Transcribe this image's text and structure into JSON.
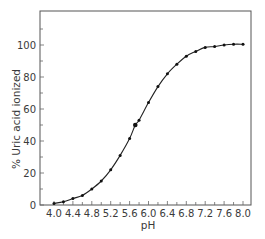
{
  "chart_data": {
    "type": "line",
    "title": "",
    "xlabel": "pH",
    "ylabel": "% Uric acid ionized",
    "xlim": [
      3.7,
      8.2
    ],
    "ylim": [
      0,
      120
    ],
    "x_ticks": [
      4.0,
      4.4,
      4.8,
      5.2,
      5.6,
      6.0,
      6.4,
      6.8,
      7.2,
      7.6,
      8.0
    ],
    "x_tick_labels": [
      "4.0",
      "4.4",
      "4.8",
      "5.2",
      "5.6",
      "6.0",
      "6.4",
      "6.8",
      "7.2",
      "7.6",
      "8.0"
    ],
    "x_minor_step": 0.2,
    "y_ticks": [
      0,
      20,
      40,
      60,
      80,
      100
    ],
    "y_tick_labels": [
      "0",
      "20",
      "40",
      "60",
      "80",
      "100"
    ],
    "y_minor_step": 10,
    "grid": false,
    "legend": null,
    "series": [
      {
        "name": "% Uric acid ionized",
        "x": [
          4.0,
          4.2,
          4.4,
          4.6,
          4.8,
          5.0,
          5.2,
          5.4,
          5.6,
          5.72,
          5.8,
          6.0,
          6.2,
          6.4,
          6.6,
          6.8,
          7.0,
          7.2,
          7.4,
          7.6,
          7.8,
          8.0
        ],
        "y": [
          1,
          2,
          4,
          6,
          10,
          15,
          22,
          31,
          41.5,
          50,
          53,
          64,
          74,
          82,
          88,
          93,
          96,
          98.5,
          99,
          100,
          100.5,
          100.5
        ],
        "highlight_point": {
          "x": 5.72,
          "y": 50
        }
      }
    ]
  }
}
